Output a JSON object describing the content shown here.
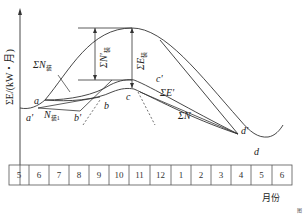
{
  "diagram": {
    "type": "cumulative water-energy curve",
    "y_axis_label": "ΣE/(kW・月)",
    "x_axis_label": "月份",
    "months": [
      "5",
      "6",
      "7",
      "8",
      "9",
      "10",
      "11",
      "12",
      "1",
      "2",
      "3",
      "4",
      "5",
      "6"
    ],
    "curve_labels": {
      "sum_n_installed": "ΣN",
      "sum_n_installed_sub": "装",
      "n_installed_1": "N",
      "n_installed_1_sub": "装1",
      "sum_n_prime": "ΣN'",
      "sum_n_prime_sub": "装",
      "sum_e": "ΣE",
      "sum_e_sub": "装",
      "sum_e_prime": "ΣE'",
      "sum_n": "ΣN"
    },
    "points": {
      "a": "a",
      "a_prime": "a'",
      "b": "b",
      "b_prime": "b'",
      "c": "c",
      "c_prime": "c'",
      "d": "d",
      "d_prime": "d'"
    },
    "figure_mark": "图"
  }
}
